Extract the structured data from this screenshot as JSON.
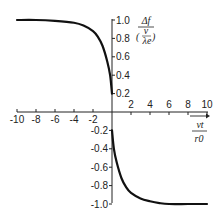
{
  "chart_data": {
    "type": "line",
    "title": "",
    "xlabel": "vt / r0",
    "ylabel": "Δf / (v/λe)",
    "xlim": [
      -10,
      10
    ],
    "ylim": [
      -1.0,
      1.0
    ],
    "grid": false,
    "legend": null,
    "x_ticks": [
      "-10",
      "-8",
      "-6",
      "-4",
      "-2",
      "2",
      "4",
      "6",
      "8",
      "10"
    ],
    "y_ticks": [
      "1.0",
      "0.8",
      "0.6",
      "0.4",
      "0.2",
      "-0.2",
      "-0.4",
      "-0.6",
      "-0.8",
      "-1.0"
    ],
    "series": [
      {
        "name": "negative-time branch",
        "x": [
          -10,
          -8,
          -6,
          -4,
          -3,
          -2,
          -1.5,
          -1,
          -0.5,
          -0.2,
          0
        ],
        "y": [
          1.0,
          1.0,
          0.99,
          0.97,
          0.94,
          0.88,
          0.82,
          0.72,
          0.55,
          0.4,
          0.2
        ]
      },
      {
        "name": "positive-time branch",
        "x": [
          0,
          0.2,
          0.5,
          1,
          1.5,
          2,
          3,
          4,
          5,
          6,
          8,
          10
        ],
        "y": [
          -0.2,
          -0.4,
          -0.55,
          -0.72,
          -0.82,
          -0.88,
          -0.94,
          -0.97,
          -0.99,
          -1.0,
          -1.0,
          -1.0
        ]
      }
    ],
    "colors": {
      "line": "#111111",
      "axis": "#222222"
    }
  },
  "labels": {
    "y_num": "Δf",
    "y_den_num": "v",
    "y_den_den": "λe",
    "x_num": "vt",
    "x_den": "r0"
  }
}
